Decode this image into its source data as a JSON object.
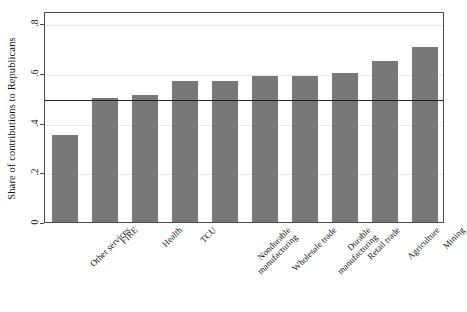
{
  "chart_data": {
    "type": "bar",
    "title": "",
    "subtitle": "",
    "xlabel": "",
    "ylabel": "Share of contributions to Republicans",
    "categories": [
      "Other services",
      "FIRE",
      "Health",
      "TCU",
      "Nondurable manufacturing",
      "Wholesale trade",
      "Durable manufacturing",
      "Retail trade",
      "Agriculture",
      "Mining"
    ],
    "values": [
      0.35,
      0.5,
      0.51,
      0.57,
      0.57,
      0.59,
      0.59,
      0.6,
      0.65,
      0.705
    ],
    "ylim": [
      0,
      0.85
    ],
    "yticks": [
      0,
      0.2,
      0.4,
      0.6,
      0.8
    ],
    "ytick_labels": [
      "0",
      ".2",
      ".4",
      ".6",
      ".8"
    ],
    "grid": "horizontal",
    "legend": "none",
    "annotations": [
      {
        "type": "reference-line",
        "orientation": "horizontal",
        "value": 0.5,
        "label": "",
        "color": "#222222"
      }
    ],
    "bar_color": "#787878",
    "gridline_color": "#e7e7e7",
    "frame_color": "#4a4a4a",
    "background_color": "#ffffff"
  },
  "axis": {
    "y_title": "Share of contributions to Republicans",
    "y_tick_labels": [
      "0",
      ".2",
      ".4",
      ".6",
      ".8"
    ]
  },
  "bars": [
    {
      "label_line1": "Other services",
      "label_line2": "",
      "value": 0.35
    },
    {
      "label_line1": "FIRE",
      "label_line2": "",
      "value": 0.5
    },
    {
      "label_line1": "Health",
      "label_line2": "",
      "value": 0.51
    },
    {
      "label_line1": "TCU",
      "label_line2": "",
      "value": 0.57
    },
    {
      "label_line1": "Nondurable",
      "label_line2": "manufacturing",
      "value": 0.57
    },
    {
      "label_line1": "Wholesale trade",
      "label_line2": "",
      "value": 0.59
    },
    {
      "label_line1": "Durable",
      "label_line2": "manufacturing",
      "value": 0.59
    },
    {
      "label_line1": "Retail trade",
      "label_line2": "",
      "value": 0.6
    },
    {
      "label_line1": "Agriculture",
      "label_line2": "",
      "value": 0.65
    },
    {
      "label_line1": "Mining",
      "label_line2": "",
      "value": 0.705
    }
  ]
}
